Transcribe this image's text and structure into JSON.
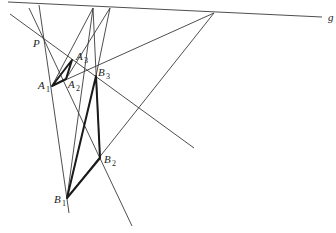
{
  "diagram": {
    "line_label": "g",
    "labels": {
      "P": {
        "text": "P"
      },
      "A1": {
        "letter": "A",
        "index": "1"
      },
      "A2": {
        "letter": "A",
        "index": "2"
      },
      "A3": {
        "letter": "A",
        "index": "3"
      },
      "B1": {
        "letter": "B",
        "index": "1"
      },
      "B2": {
        "letter": "B",
        "index": "2"
      },
      "B3": {
        "letter": "B",
        "index": "3"
      }
    },
    "points": {
      "P": [
        43,
        40
      ],
      "A1": [
        52,
        86
      ],
      "A2": [
        66,
        79
      ],
      "A3": [
        72,
        60
      ],
      "B1": [
        67,
        198
      ],
      "B2": [
        100,
        158
      ],
      "B3": [
        96,
        76
      ],
      "G12": [
        214,
        13
      ],
      "G13": [
        93,
        8
      ],
      "G23": [
        110,
        8
      ]
    }
  }
}
